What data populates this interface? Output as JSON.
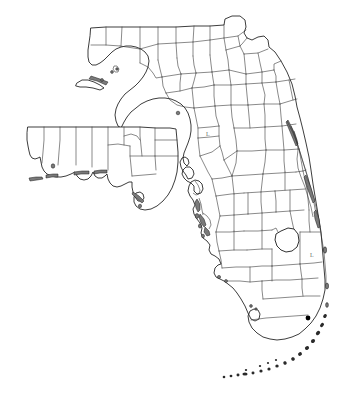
{
  "map": {
    "title": "Florida county outline map",
    "subject": "Florida",
    "style": "black line outline, white fill",
    "width_px": 355,
    "height_px": 416,
    "background_color": "#ffffff",
    "outline_color": "#1a1a1a",
    "county_line_color": "#3a3a3a",
    "island_fill_color": "#7a7a7a",
    "marker_color": "#000000",
    "label_color": "#6e6e6e",
    "labels": [
      {
        "name": "lake-county-label",
        "text": "L",
        "x": 206,
        "y": 136
      },
      {
        "name": "lake-okeechobee-label",
        "text": "L",
        "x": 310,
        "y": 257
      }
    ],
    "markers": [
      {
        "name": "southeast-city-marker",
        "x": 308,
        "y": 318,
        "r": 2.4
      }
    ],
    "features": [
      "mainland peninsula",
      "western panhandle (offset inset)",
      "Gulf coast barrier islands",
      "Atlantic coast barrier islands",
      "Indian River Lagoon",
      "Tampa Bay",
      "Charlotte Harbor",
      "Lake Okeechobee",
      "Florida Keys archipelago",
      "Florida Bay"
    ]
  }
}
